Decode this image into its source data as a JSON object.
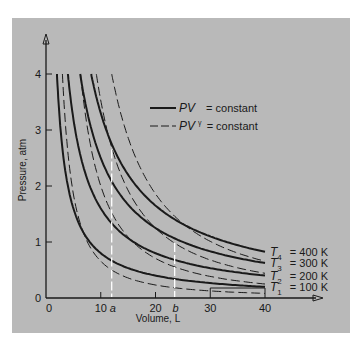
{
  "chart_data": {
    "type": "line",
    "title": "",
    "xlabel": "Volume, L",
    "ylabel": "Pressure, atm",
    "xlim": [
      0,
      40
    ],
    "ylim": [
      0,
      4
    ],
    "x_ticks": [
      "0",
      "10",
      "20",
      "30",
      "40"
    ],
    "y_ticks": [
      "0",
      "1",
      "2",
      "3",
      "4"
    ],
    "grid": false,
    "legend_position": "upper right",
    "legend": [
      {
        "style": "solid",
        "label_main": "PV",
        "label_sup": "",
        "label_rest": "= constant"
      },
      {
        "style": "dashed",
        "label_main": "PV",
        "label_sup": "γ",
        "label_rest": "= constant"
      }
    ],
    "isotherms": [
      {
        "name": "T1",
        "temperature": "100 K",
        "label_sub": "1",
        "label_value": "= 100 K",
        "constant_PV": 8
      },
      {
        "name": "T2",
        "temperature": "200 K",
        "label_sub": "2",
        "label_value": "= 200 K",
        "constant_PV": 16
      },
      {
        "name": "T3",
        "temperature": "300 K",
        "label_sub": "3",
        "label_value": "= 300 K",
        "constant_PV": 25
      },
      {
        "name": "T4",
        "temperature": "400 K",
        "label_sub": "4",
        "label_value": "= 400 K",
        "constant_PV": 33
      }
    ],
    "adiabats": [
      {
        "name": "adiabat-1",
        "V_at_P4": 3.0,
        "P_at_V40": 0.08
      },
      {
        "name": "adiabat-2",
        "V_at_P4": 6.3,
        "P_at_V40": 0.27
      },
      {
        "name": "adiabat-3",
        "V_at_P4": 9.2,
        "P_at_V40": 0.46
      },
      {
        "name": "adiabat-4",
        "V_at_P4": 12.0,
        "P_at_V40": 0.64
      }
    ],
    "gamma_approx": 1.5,
    "markers": [
      {
        "label": "a",
        "V": 12,
        "P_top": 2.65,
        "style": "white dashed vertical"
      },
      {
        "label": "b",
        "V": 23.5,
        "P_top": 0.98,
        "style": "white dashed vertical"
      }
    ]
  },
  "colors": {
    "panel_bg": "#b9b9b9",
    "ink": "#1a1a1a",
    "marker": "#ffffff"
  }
}
